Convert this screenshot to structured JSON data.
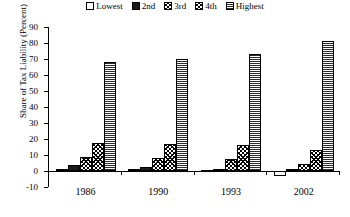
{
  "chart_data": {
    "type": "bar",
    "title": "",
    "xlabel": "",
    "ylabel": "Share of Tax Liability (Percent)",
    "categories": [
      "1986",
      "1990",
      "1993",
      "2002"
    ],
    "ylim": [
      -10,
      90
    ],
    "ytick_step": 10,
    "yticks": [
      "90",
      "80",
      "70",
      "60",
      "50",
      "40",
      "30",
      "20",
      "10",
      "0",
      "-10"
    ],
    "grid": false,
    "legend_position": "top-center",
    "series": [
      {
        "name": "Lowest",
        "pattern": "white",
        "values": [
          0.4,
          0.0,
          -0.9,
          -3.0
        ]
      },
      {
        "name": "2nd",
        "pattern": "solid-black",
        "values": [
          3.5,
          2.6,
          1.4,
          0.0
        ]
      },
      {
        "name": "3rd",
        "pattern": "cross-hatch",
        "values": [
          8.9,
          8.4,
          7.2,
          4.6
        ]
      },
      {
        "name": "4th",
        "pattern": "diagonal-hatch",
        "values": [
          17.8,
          16.6,
          16.0,
          13.4
        ]
      },
      {
        "name": "Highest",
        "pattern": "horizontal-lines",
        "values": [
          68.3,
          70.0,
          73.0,
          81.0
        ]
      }
    ]
  },
  "legend": {
    "items": [
      {
        "label": "Lowest"
      },
      {
        "label": "2nd"
      },
      {
        "label": "3rd"
      },
      {
        "label": "4th"
      },
      {
        "label": "Highest"
      }
    ]
  },
  "axes": {
    "y_title": "Share of Tax Liability (Percent)"
  },
  "colors": {
    "axis": "#000000",
    "bar_outline": "#000000",
    "solid_fill": "#1a1a1a",
    "background": "#ffffff"
  }
}
